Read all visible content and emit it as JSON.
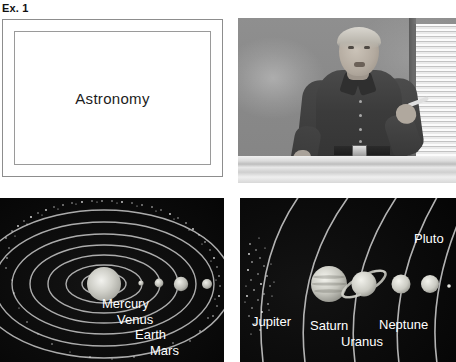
{
  "caption": {
    "label": "Ex. 1"
  },
  "slide": {
    "title": "Astronomy"
  },
  "video": {
    "scene": "lecturer-at-chalkboard",
    "subject": "presenter",
    "background": "chalkboard-with-window-blinds"
  },
  "inner_system": {
    "title": "inner-solar-system-diagram",
    "sun": "Sun",
    "labels": [
      "Mercury",
      "Venus",
      "Earth",
      "Mars"
    ],
    "feature": "asteroid-belt"
  },
  "outer_system": {
    "title": "outer-solar-system-diagram",
    "labels": [
      "Jupiter",
      "Saturn",
      "Uranus",
      "Neptune",
      "Pluto"
    ],
    "feature": "asteroid-belt"
  },
  "colors": {
    "page_background": "#ffffff",
    "space_background": "#0a0a0a",
    "orbit_line": "#c8c8c8",
    "label_text": "#ffffff",
    "slide_border": "#8d8d8d",
    "slide_text": "#1c1c1c"
  }
}
